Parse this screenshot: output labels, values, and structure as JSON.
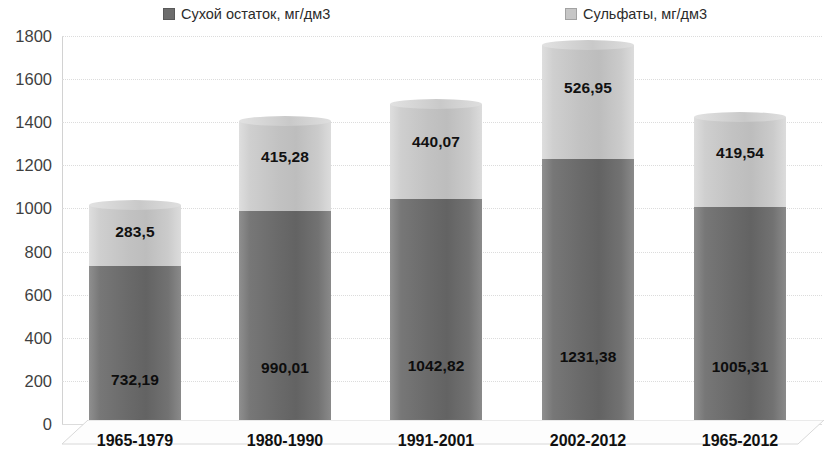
{
  "chart_data": {
    "type": "bar",
    "stacked": true,
    "title": "",
    "subtitle": "",
    "xlabel": "",
    "ylabel": "",
    "ylim": [
      0,
      1800
    ],
    "ytick_step": 200,
    "yticks": [
      0,
      200,
      400,
      600,
      800,
      1000,
      1200,
      1400,
      1600,
      1800
    ],
    "ytick_labels": [
      "0",
      "200",
      "400",
      "600",
      "800",
      "1000",
      "1200",
      "1400",
      "1600",
      "1800"
    ],
    "grid": true,
    "grid_axis": "y",
    "legend_position": "top",
    "categories": [
      "1965-1979",
      "1980-1990",
      "1991-2001",
      "2002-2012",
      "1965-2012"
    ],
    "series": [
      {
        "name": "Сухой остаток, мг/дм3",
        "color": "#6d6d6d",
        "values": [
          732.19,
          990.01,
          1042.82,
          1231.38,
          1005.31
        ],
        "labels": [
          "732,19",
          "990,01",
          "1042,82",
          "1231,38",
          "1005,31"
        ]
      },
      {
        "name": "Сульфаты, мг/дм3",
        "color": "#c6c6c6",
        "values": [
          283.5,
          415.28,
          440.07,
          526.95,
          419.54
        ],
        "labels": [
          "283,5",
          "415,28",
          "440,07",
          "526,95",
          "419,54"
        ]
      }
    ],
    "totals": [
      1015.69,
      1405.29,
      1482.89,
      1758.33,
      1424.85
    ]
  },
  "legend": {
    "items": [
      {
        "label": "Сухой остаток, мг/дм3",
        "color": "#6d6d6d",
        "marker": "square-marker"
      },
      {
        "label": "Сульфаты, мг/дм3",
        "color": "#c6c6c6",
        "marker": "square-marker"
      }
    ]
  },
  "colors": {
    "series_dark": "#6d6d6d",
    "series_light": "#c6c6c6",
    "grid": "#dcdcdc",
    "axis": "#d2d2d2",
    "text": "#111111",
    "background": "#ffffff"
  }
}
